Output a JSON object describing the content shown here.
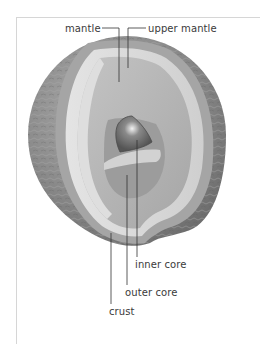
{
  "diagram": {
    "labels": {
      "mantle": "mantle",
      "upper_mantle": "upper mantle",
      "inner_core": "inner core",
      "outer_core": "outer core",
      "crust": "crust"
    },
    "colors": {
      "background": "#ffffff",
      "frame": "#d6d6d6",
      "surface": "#8a8a8a",
      "crust_band": "#a9a9a9",
      "upper_mantle_band": "#c9c9c9",
      "mantle": "#b3b3b3",
      "outer_core": "#9d9d9d",
      "inner_core": "#6f6f6f",
      "leader_line": "#333333",
      "text": "#3a3a3a"
    }
  }
}
